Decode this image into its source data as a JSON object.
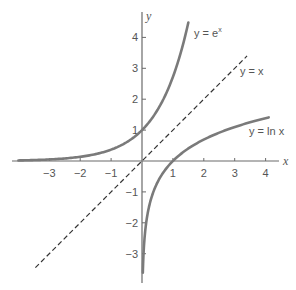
{
  "chart_data": {
    "type": "line",
    "title": "",
    "xlabel": "x",
    "ylabel": "y",
    "xlim": [
      -4.2,
      4.6
    ],
    "ylim": [
      -3.9,
      4.6
    ],
    "grid": false,
    "legend": "inline labels",
    "x_ticks": [
      -3,
      -2,
      -1,
      1,
      2,
      3,
      4
    ],
    "y_ticks": [
      -3,
      -2,
      -1,
      1,
      2,
      3,
      4
    ],
    "x_tick_labels": [
      "−3",
      "−2",
      "−1",
      "1",
      "2",
      "3",
      "4"
    ],
    "y_tick_labels": [
      "−3",
      "−2",
      "−1",
      "1",
      "2",
      "3",
      "4"
    ],
    "series": [
      {
        "name": "y = e^x",
        "label_main": "y = e",
        "label_sup": "x",
        "style": "solid",
        "color": "#7a7a7a",
        "x": [
          -4.0,
          -3.5,
          -3.0,
          -2.5,
          -2.0,
          -1.5,
          -1.0,
          -0.5,
          0.0,
          0.25,
          0.5,
          0.75,
          1.0,
          1.25,
          1.52
        ],
        "y": [
          0.018,
          0.03,
          0.05,
          0.082,
          0.135,
          0.223,
          0.368,
          0.607,
          1.0,
          1.284,
          1.649,
          2.117,
          2.718,
          3.49,
          4.57
        ]
      },
      {
        "name": "y = x",
        "label_main": "y = x",
        "style": "dashed",
        "color": "#333333",
        "x": [
          -3.45,
          3.4
        ],
        "y": [
          -3.45,
          3.4
        ]
      },
      {
        "name": "y = ln x",
        "label_main": "y = ln x",
        "style": "solid",
        "color": "#7a7a7a",
        "x": [
          0.027,
          0.04,
          0.06,
          0.1,
          0.15,
          0.2,
          0.3,
          0.5,
          0.75,
          1.0,
          1.5,
          2.0,
          2.5,
          3.0,
          3.5,
          4.1
        ],
        "y": [
          -3.6,
          -3.22,
          -2.81,
          -2.3,
          -1.9,
          -1.61,
          -1.2,
          -0.69,
          -0.29,
          0.0,
          0.405,
          0.693,
          0.916,
          1.099,
          1.253,
          1.411
        ]
      }
    ]
  },
  "colors": {
    "axis": "#6a6a6a",
    "curve": "#7a7a7a",
    "dashed": "#333333",
    "text": "#555555",
    "background": "#ffffff"
  }
}
